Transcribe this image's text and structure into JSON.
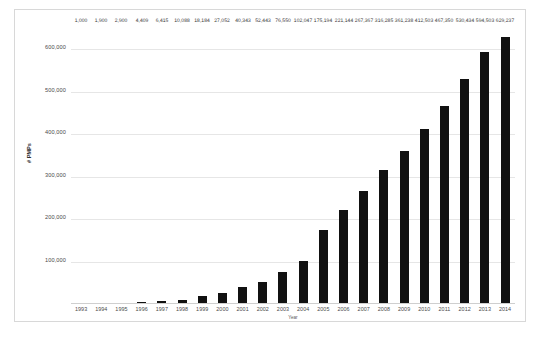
{
  "chart_data": {
    "type": "bar",
    "title": "",
    "xlabel": "Year",
    "ylabel": "# PMPs",
    "categories": [
      "1993",
      "1994",
      "1995",
      "1996",
      "1997",
      "1998",
      "1999",
      "2000",
      "2001",
      "2002",
      "2003",
      "2004",
      "2005",
      "2006",
      "2007",
      "2008",
      "2009",
      "2010",
      "2011",
      "2012",
      "2013",
      "2014"
    ],
    "values": [
      1000,
      1900,
      2900,
      4409,
      6415,
      10088,
      18184,
      27052,
      40343,
      52443,
      76550,
      102047,
      175194,
      221144,
      267367,
      316285,
      361238,
      412503,
      467350,
      530434,
      594503,
      629237
    ],
    "value_labels": [
      "1,000",
      "1,900",
      "2,900",
      "4,409",
      "6,415",
      "10,088",
      "18,184",
      "27,052",
      "40,343",
      "52,443",
      "76,550",
      "102,047",
      "175,194",
      "221,144",
      "267,367",
      "316,285",
      "361,238",
      "412,503",
      "467,350",
      "530,434",
      "594,503",
      "629,237"
    ],
    "ylim": [
      0,
      660000
    ],
    "yticks": [
      100000,
      200000,
      300000,
      400000,
      500000,
      600000
    ],
    "ytick_labels": [
      "100,000",
      "200,000",
      "300,000",
      "400,000",
      "500,000",
      "600,000"
    ],
    "grid": true,
    "legend": "none",
    "bar_color": "#111111"
  }
}
